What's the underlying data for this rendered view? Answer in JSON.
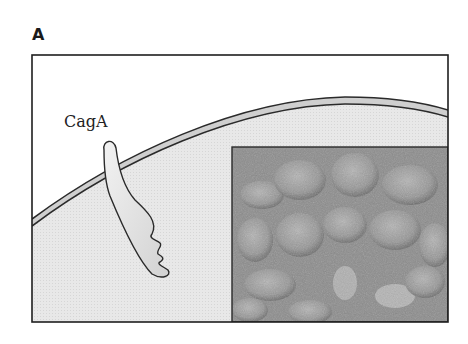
{
  "figure": {
    "panel_label": "A",
    "labels": {
      "protein": "CagA"
    },
    "elements": {
      "cell_membrane": "curved double-line plasma membrane",
      "cytoplasm": "light gray stippled region",
      "protein_shape": "CagA protein inserted through membrane",
      "micrograph_inset": "gray-scale micrograph of epithelial cells"
    },
    "colors": {
      "frame": "#1f1f1f",
      "cytoplasm": "#e6e6e6",
      "membrane_fill": "#c9c9c9",
      "protein_fill": "#e2e2e2",
      "micrograph_base": "#8a8a8a"
    }
  }
}
